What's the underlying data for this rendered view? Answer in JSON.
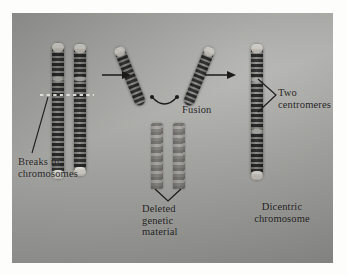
{
  "figure": {
    "media": "photographic plate",
    "background_color": "#a3a3a0",
    "ink_color": "#141312"
  },
  "labels": {
    "breaks": "Breaks in\nchromosomes",
    "fusion": "Fusion",
    "deleted": "Deleted\ngenetic\nmaterial",
    "two_centromeres": "Two\ncentromeres",
    "dicentric": "Dicentric\nchromosome"
  },
  "stages": [
    {
      "id": "stage-1-broken-chromosomes",
      "name": "Two chromosomes with breaks",
      "element_count": 2,
      "annotation": "Breaks in\nchromosomes"
    },
    {
      "id": "stage-2-fusion",
      "name": "Broken arms fusing into a V",
      "element_count": 2,
      "annotation": "Fusion"
    },
    {
      "id": "stage-3-deleted-material",
      "name": "Discarded acentric fragments",
      "element_count": 2,
      "annotation": "Deleted\ngenetic\nmaterial"
    },
    {
      "id": "stage-4-dicentric",
      "name": "Resulting dicentric chromosome",
      "element_count": 1,
      "annotation": "Dicentric\nchromosome"
    }
  ],
  "markers": {
    "break_line": "white dashed line across both chromosomes",
    "arrow_1": "process-arrow",
    "arrow_2": "process-arrow",
    "fusion_arc": "curved joining arc with endpoint dots",
    "centromere_bracket": "V bracket pointing to two centromeres",
    "deleted_bracket": "V bracket pointing to deleted fragments",
    "breaks_leader": "leader line to break point"
  }
}
